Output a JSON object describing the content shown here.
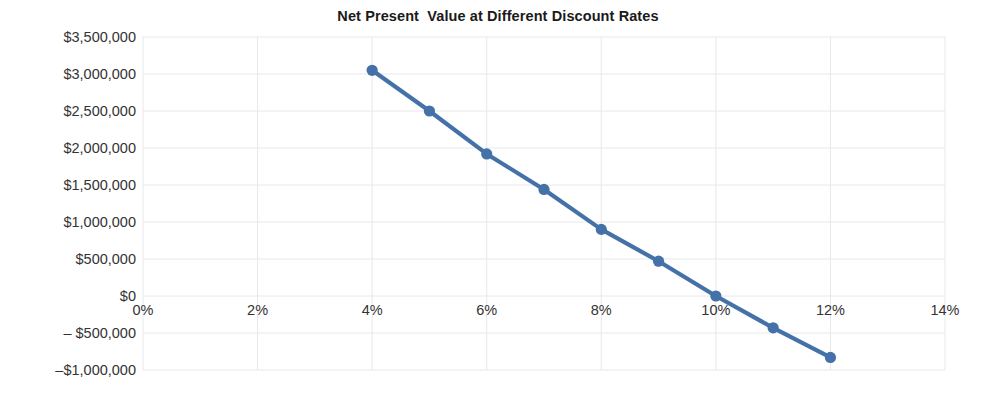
{
  "chart_data": {
    "type": "line",
    "title": "Net Present  Value at Different Discount Rates",
    "xlabel": "",
    "ylabel": "",
    "x": [
      4,
      5,
      6,
      7,
      8,
      9,
      10,
      11,
      12
    ],
    "values": [
      3050000,
      2500000,
      1920000,
      1440000,
      900000,
      470000,
      0,
      -430000,
      -830000
    ],
    "series": [
      {
        "name": "Net Present Value",
        "values": [
          3050000,
          2500000,
          1920000,
          1440000,
          900000,
          470000,
          0,
          -430000,
          -830000
        ]
      }
    ],
    "xlim": [
      0,
      14
    ],
    "ylim": [
      -1000000,
      3500000
    ],
    "x_tick_values": [
      0,
      2,
      4,
      6,
      8,
      10,
      12,
      14
    ],
    "x_tick_labels": [
      "0%",
      "2%",
      "4%",
      "6%",
      "8%",
      "10%",
      "12%",
      "14%"
    ],
    "y_tick_values": [
      3500000,
      3000000,
      2500000,
      2000000,
      1500000,
      1000000,
      500000,
      0,
      -500000,
      -1000000
    ],
    "y_tick_labels": [
      "$3,500,000",
      "$3,000,000",
      "$2,500,000",
      "$2,000,000",
      "$1,500,000",
      "$1,000,000",
      "$500,000",
      "$0",
      "– $500,000",
      "–$1,000,000"
    ],
    "grid": true,
    "legend": false,
    "legend_position": "none",
    "line_color": "#4472a8",
    "marker_color": "#4472a8",
    "grid_color": "#e8e8ec",
    "text_color": "#333333",
    "background_color": "#ffffff"
  }
}
